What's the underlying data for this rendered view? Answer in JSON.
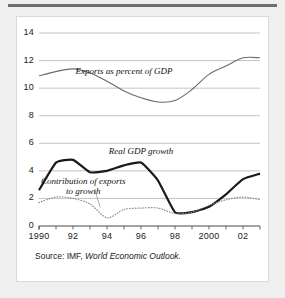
{
  "figure": {
    "source_prefix": "Source: IMF, ",
    "source_italic": "World Economic Outlook."
  },
  "colors": {
    "page_background": "#efefef",
    "card_background": "#ffffff",
    "card_border": "#d9d9d9",
    "top_rule": "#6e6e6e",
    "gridline": "#b5b5b5",
    "axis": "#4a4a4a",
    "exports_line": "#6b6b6b",
    "gdp_line": "#1a1a1a",
    "contribution_line": "#8a8a8a",
    "text": "#1a1a1a"
  },
  "chart_data": {
    "type": "line",
    "title": "",
    "xlabel": "",
    "ylabel": "",
    "xlim": [
      1990,
      2003
    ],
    "ylim": [
      0,
      14
    ],
    "ytick_step": 2,
    "grid": true,
    "legend": "inline-annotations",
    "yticks": [
      "0",
      "2",
      "4",
      "6",
      "8",
      "10",
      "12",
      "14"
    ],
    "ytick_values": [
      0,
      2,
      4,
      6,
      8,
      10,
      12,
      14
    ],
    "xticks": [
      "1990",
      "92",
      "94",
      "96",
      "98",
      "2000",
      "02"
    ],
    "xtick_values": [
      1990,
      1992,
      1994,
      1996,
      1998,
      2000,
      2002
    ],
    "x": [
      1990,
      1991,
      1992,
      1993,
      1994,
      1995,
      1996,
      1997,
      1998,
      1999,
      2000,
      2001,
      2002,
      2003
    ],
    "series": [
      {
        "name": "Exports as percent of GDP",
        "style": "solid-thin",
        "color": "#6b6b6b",
        "values": [
          10.9,
          11.2,
          11.4,
          11.1,
          10.5,
          9.8,
          9.3,
          9.0,
          9.1,
          9.9,
          11.0,
          11.6,
          12.2,
          12.2
        ]
      },
      {
        "name": "Real GDP growth",
        "style": "solid-bold",
        "color": "#1a1a1a",
        "values": [
          2.6,
          4.6,
          4.8,
          3.9,
          4.0,
          4.4,
          4.6,
          3.3,
          1.0,
          1.0,
          1.4,
          2.3,
          3.4,
          3.8
        ]
      },
      {
        "name": "Contribution of exports to growth",
        "style": "dotted",
        "color": "#8a8a8a",
        "values": [
          1.7,
          2.1,
          2.0,
          1.6,
          0.6,
          1.2,
          1.3,
          1.3,
          0.9,
          1.0,
          1.5,
          1.9,
          2.1,
          1.9
        ]
      }
    ],
    "annotations": [
      {
        "text": "Exports as percent of GDP",
        "x": 1995.0,
        "y": 11.2
      },
      {
        "text": "Real GDP growth",
        "x": 1996.0,
        "y": 5.4
      },
      {
        "text_line1": "Contribution of exports",
        "text_line2": "to growth",
        "x": 1992.6,
        "y": 3.2
      }
    ]
  }
}
